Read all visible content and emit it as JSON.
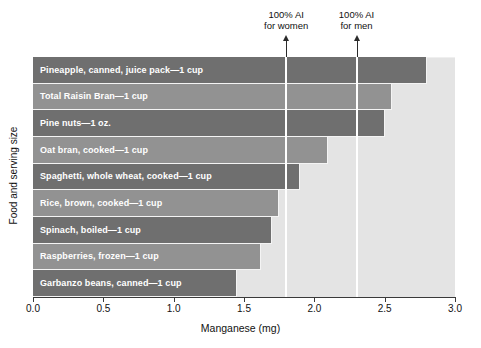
{
  "chart_data": {
    "type": "bar",
    "orientation": "horizontal",
    "title": "",
    "xlabel": "Manganese (mg)",
    "ylabel": "Food and serving size",
    "xlim": [
      0.0,
      3.0
    ],
    "xticks": [
      "0.0",
      "0.5",
      "1.0",
      "1.5",
      "2.0",
      "2.5",
      "3.0"
    ],
    "xtick_values": [
      0.0,
      0.5,
      1.0,
      1.5,
      2.0,
      2.5,
      3.0
    ],
    "grid": false,
    "legend": "none",
    "categories": [
      "Pineapple, canned, juice pack—1 cup",
      "Total Raisin Bran—1 cup",
      "Pine nuts—1 oz.",
      "Oat bran, cooked—1 cup",
      "Spaghetti, whole wheat, cooked—1 cup",
      "Rice, brown, cooked—1 cup",
      "Spinach, boiled—1 cup",
      "Raspberries, frozen—1 cup",
      "Garbanzo beans, canned—1 cup"
    ],
    "values": [
      2.8,
      2.55,
      2.5,
      2.1,
      1.9,
      1.75,
      1.7,
      1.62,
      1.45
    ],
    "bar_colors": [
      "#6f6f6f",
      "#929292",
      "#6f6f6f",
      "#929292",
      "#6f6f6f",
      "#929292",
      "#6f6f6f",
      "#929292",
      "#6f6f6f"
    ],
    "annotations": [
      {
        "line1": "100% AI",
        "line2": "for women",
        "value": 1.8,
        "kind": "reference-line-with-arrow"
      },
      {
        "line1": "100% AI",
        "line2": "for men",
        "value": 2.3,
        "kind": "reference-line-with-arrow"
      }
    ],
    "colors": {
      "plot_background": "#e4e4e4",
      "bar_dark": "#6f6f6f",
      "bar_light": "#929292",
      "reference_line": "#ffffff",
      "axis": "#3a3a3a",
      "bar_label_text": "#ffffff"
    }
  }
}
